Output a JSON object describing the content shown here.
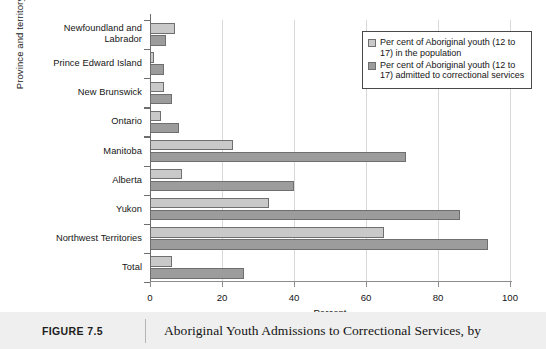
{
  "chart_data": {
    "type": "bar",
    "orientation": "horizontal",
    "title": "Aboriginal Youth Admissions to Correctional Services, by",
    "xlabel": "Percent",
    "ylabel": "Province and territory",
    "xlim": [
      0,
      100
    ],
    "xticks": [
      0,
      20,
      40,
      60,
      80,
      100
    ],
    "xtick_labels": [
      "0",
      "20",
      "40",
      "60",
      "80",
      "100"
    ],
    "grid": true,
    "grid_axis": "x",
    "legend_position": "upper right",
    "categories": [
      "Newfoundland and Labrador",
      "Prince Edward Island",
      "New Brunswick",
      "Ontario",
      "Manitoba",
      "Alberta",
      "Yukon",
      "Northwest Territories",
      "Total"
    ],
    "series": [
      {
        "name": "Per cent of Aboriginal youth (12 to 17) in the population",
        "color": "#c9c9c9",
        "values": [
          7,
          1,
          4,
          3,
          23,
          9,
          33,
          65,
          6
        ]
      },
      {
        "name": "Per cent of Aboriginal youth (12 to 17) admitted to correctional services",
        "color": "#9c9c9c",
        "values": [
          4.5,
          4,
          6,
          8,
          71,
          40,
          86,
          94,
          26
        ]
      }
    ]
  },
  "legend": {
    "entries": [
      "Per cent of Aboriginal youth (12 to 17) in the population",
      "Per cent of Aboriginal youth (12 to 17) admitted to correctional services"
    ]
  },
  "caption": {
    "label": "FIGURE 7.5",
    "title": "Aboriginal Youth Admissions to Correctional Services, by"
  }
}
